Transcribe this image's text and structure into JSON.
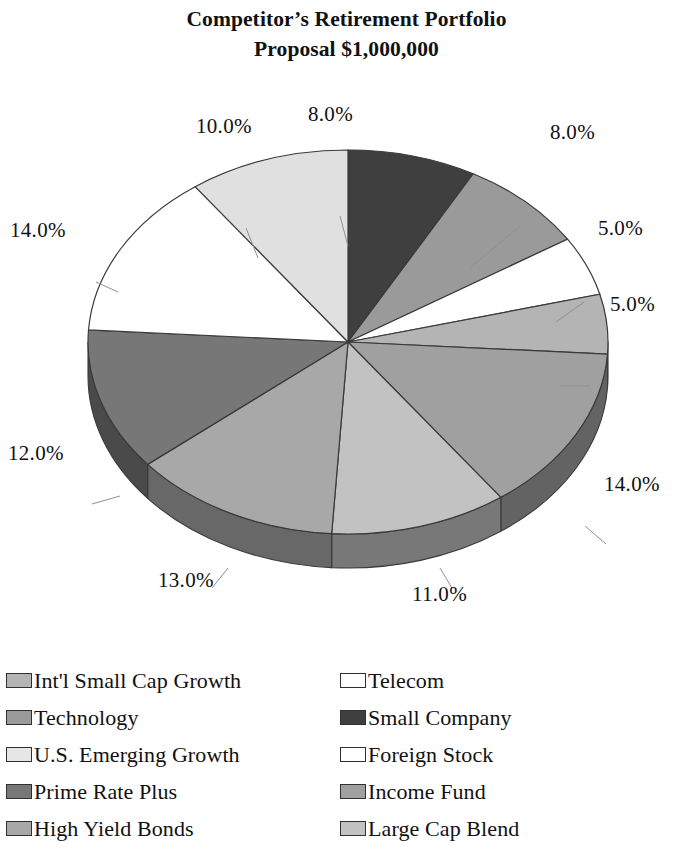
{
  "title": {
    "line1": "Competitor’s Retirement Portfolio",
    "line2": "Proposal $1,000,000"
  },
  "chart_data": {
    "type": "pie",
    "title": "Competitor’s Retirement Portfolio Proposal $1,000,000",
    "subtitle": "",
    "xlabel": "",
    "ylabel": "",
    "grid": false,
    "legend_position": "bottom",
    "three_d": true,
    "units": "percent",
    "total": 100,
    "start_angle_deg": 0,
    "direction": "clockwise",
    "labels": [
      "Small Company",
      "Technology",
      "Telecom",
      "Int'l Small Cap Growth",
      "Income Fund",
      "Large Cap Blend",
      "High Yield Bonds",
      "Prime Rate Plus",
      "Foreign Stock",
      "U.S. Emerging Growth"
    ],
    "values": [
      8.0,
      8.0,
      5.0,
      5.0,
      14.0,
      11.0,
      13.0,
      12.0,
      14.0,
      10.0
    ],
    "value_labels": [
      "8.0%",
      "8.0%",
      "5.0%",
      "5.0%",
      "14.0%",
      "11.0%",
      "13.0%",
      "12.0%",
      "14.0%",
      "10.0%"
    ],
    "colors": [
      "#3f3f3f",
      "#9a9a9a",
      "#ffffff",
      "#b4b4b4",
      "#a0a0a0",
      "#c2c2c2",
      "#a8a8a8",
      "#777777",
      "#ffffff",
      "#e0e0e0"
    ],
    "slices": [
      {
        "label": "Small Company",
        "value": 8.0,
        "value_label": "8.0%",
        "color": "#3f3f3f"
      },
      {
        "label": "Technology",
        "value": 8.0,
        "value_label": "8.0%",
        "color": "#9a9a9a"
      },
      {
        "label": "Telecom",
        "value": 5.0,
        "value_label": "5.0%",
        "color": "#ffffff"
      },
      {
        "label": "Int'l Small Cap Growth",
        "value": 5.0,
        "value_label": "5.0%",
        "color": "#b4b4b4"
      },
      {
        "label": "Income Fund",
        "value": 14.0,
        "value_label": "14.0%",
        "color": "#a0a0a0"
      },
      {
        "label": "Large Cap Blend",
        "value": 11.0,
        "value_label": "11.0%",
        "color": "#c2c2c2"
      },
      {
        "label": "High Yield Bonds",
        "value": 13.0,
        "value_label": "13.0%",
        "color": "#a8a8a8"
      },
      {
        "label": "Prime Rate Plus",
        "value": 12.0,
        "value_label": "12.0%",
        "color": "#777777"
      },
      {
        "label": "Foreign Stock",
        "value": 14.0,
        "value_label": "14.0%",
        "color": "#ffffff"
      },
      {
        "label": "U.S. Emerging Growth",
        "value": 10.0,
        "value_label": "10.0%",
        "color": "#e0e0e0"
      }
    ]
  },
  "pie_labels": {
    "top_center": "8.0%",
    "upper_right": "8.0%",
    "right_upper": "5.0%",
    "right_lower": "5.0%",
    "right_bottom": "14.0%",
    "bottom_center": "11.0%",
    "bottom_left": "13.0%",
    "left_lower": "12.0%",
    "left_center": "14.0%",
    "upper_left": "10.0%"
  },
  "legend": {
    "left_column": [
      {
        "label": "Int'l Small Cap Growth",
        "color": "#b4b4b4"
      },
      {
        "label": "Technology",
        "color": "#9a9a9a"
      },
      {
        "label": "U.S. Emerging Growth",
        "color": "#e6e6e6"
      },
      {
        "label": "Prime Rate Plus",
        "color": "#777777"
      },
      {
        "label": "High Yield Bonds",
        "color": "#a8a8a8"
      }
    ],
    "right_column": [
      {
        "label": "Telecom",
        "color": "#ffffff"
      },
      {
        "label": "Small Company",
        "color": "#3f3f3f"
      },
      {
        "label": "Foreign Stock",
        "color": "#ffffff"
      },
      {
        "label": "Income Fund",
        "color": "#a0a0a0"
      },
      {
        "label": "Large Cap Blend",
        "color": "#c2c2c2"
      }
    ]
  }
}
